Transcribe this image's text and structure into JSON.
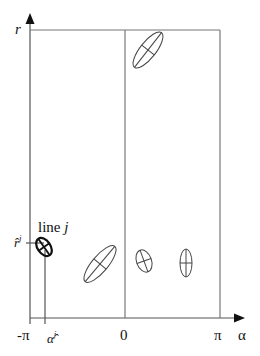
{
  "diagram": {
    "y_axis_label": "r",
    "x_axis_label": "α",
    "x_ticks": {
      "min": "-π",
      "zero": "0",
      "max": "π"
    },
    "alpha_hat_label": "α̂",
    "alpha_hat_sup": "j",
    "r_hat_label": "r̂",
    "r_hat_sup": "j",
    "line_label_prefix": "line ",
    "line_label_index": "j",
    "ellipses": [
      {
        "id": "top",
        "highlighted": false
      },
      {
        "id": "line-j",
        "highlighted": true
      },
      {
        "id": "lower-left",
        "highlighted": false
      },
      {
        "id": "lower-middle",
        "highlighted": false
      },
      {
        "id": "lower-right",
        "highlighted": false
      }
    ]
  }
}
